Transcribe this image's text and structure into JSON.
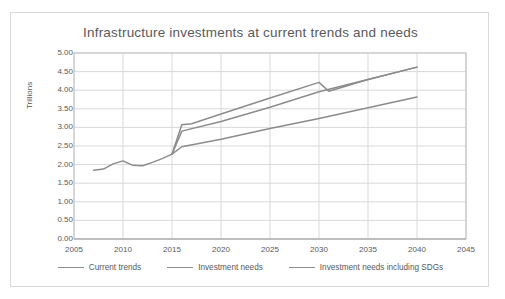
{
  "chart_data": {
    "type": "line",
    "title": "Infrastructure investments at current trends and needs",
    "xlabel": "",
    "ylabel": "Trillions",
    "xlim": [
      2005,
      2045
    ],
    "ylim": [
      0.0,
      5.0
    ],
    "grid": true,
    "legend_position": "bottom",
    "x_ticks": [
      "2005",
      "2010",
      "2015",
      "2020",
      "2025",
      "2030",
      "2035",
      "2040",
      "2045"
    ],
    "y_ticks": [
      "5.00",
      "4.50",
      "4.00",
      "3.50",
      "3.00",
      "2.50",
      "2.00",
      "1.50",
      "1.00",
      "0.50",
      "0.00"
    ],
    "series": [
      {
        "name": "Current trends",
        "color": "#8c8c8c",
        "x": [
          2007,
          2008,
          2009,
          2010,
          2011,
          2012,
          2013,
          2014,
          2015,
          2016,
          2020,
          2025,
          2030,
          2035,
          2040
        ],
        "values": [
          1.85,
          1.88,
          2.02,
          2.1,
          1.98,
          1.97,
          2.06,
          2.16,
          2.28,
          2.48,
          2.68,
          2.97,
          3.24,
          3.53,
          3.82
        ]
      },
      {
        "name": "Investment needs",
        "color": "#8c8c8c",
        "x": [
          2015,
          2016,
          2020,
          2025,
          2030,
          2035,
          2040
        ],
        "values": [
          2.28,
          2.9,
          3.16,
          3.54,
          3.96,
          4.29,
          4.62
        ]
      },
      {
        "name": "Investment needs including SDGs",
        "color": "#8c8c8c",
        "x": [
          2015,
          2016,
          2017,
          2020,
          2025,
          2030,
          2031,
          2035,
          2040
        ],
        "values": [
          2.28,
          3.07,
          3.1,
          3.36,
          3.79,
          4.21,
          3.97,
          4.29,
          4.62
        ]
      }
    ]
  },
  "legend": {
    "items": [
      {
        "label": "Current trends"
      },
      {
        "label": "Investment needs"
      },
      {
        "label": "Investment needs including SDGs"
      }
    ]
  }
}
